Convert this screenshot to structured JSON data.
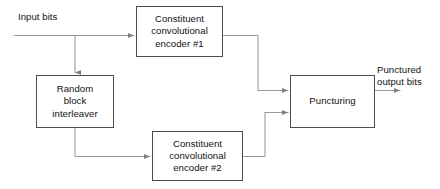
{
  "diagram": {
    "type": "block-flow-diagram",
    "background_color": "#ffffff",
    "line_color": "#8c8c8c",
    "box_border_color": "#4d4d4d",
    "text_color": "#121212",
    "nodes": [
      {
        "id": "encoder1",
        "label": "Constituent\nconvolutional\nencoder #1"
      },
      {
        "id": "interleaver",
        "label": "Random\nblock\ninterleaver"
      },
      {
        "id": "encoder2",
        "label": "Constituent\nconvolutional\nencoder #2"
      },
      {
        "id": "puncturing",
        "label": "Puncturing"
      }
    ],
    "labels": {
      "input": "Input bits",
      "output": "Punctured\noutput bits"
    }
  }
}
